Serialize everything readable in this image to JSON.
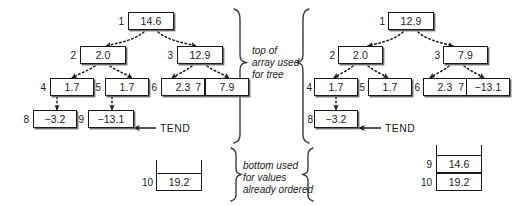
{
  "figure": {
    "pointer_label_left": "TEND",
    "pointer_label_right": "TEND",
    "captions": {
      "top": [
        "top of",
        "array used",
        "for tree"
      ],
      "bottom": [
        "bottom used",
        "for values",
        "already ordered"
      ]
    }
  },
  "left_diagram": {
    "name": "before-extraction",
    "tree_nodes": [
      {
        "index": "1",
        "value": "14.6",
        "row": 0
      },
      {
        "index": "2",
        "value": "2.0",
        "row": 1
      },
      {
        "index": "3",
        "value": "12.9",
        "row": 1
      },
      {
        "index": "4",
        "value": "1.7",
        "row": 2
      },
      {
        "index": "5",
        "value": "1.7",
        "row": 2
      },
      {
        "index": "6",
        "value": "2.3",
        "row": 2
      },
      {
        "index": "7",
        "value": "7.9",
        "row": 2
      },
      {
        "index": "8",
        "value": "−3.2",
        "row": 3
      },
      {
        "index": "9",
        "value": "−13.1",
        "row": 3
      }
    ],
    "sorted_cells": [
      {
        "index": "10",
        "value": "19.2"
      }
    ],
    "tend_target_index": "9"
  },
  "right_diagram": {
    "name": "after-extraction",
    "tree_nodes": [
      {
        "index": "1",
        "value": "12.9",
        "row": 0
      },
      {
        "index": "2",
        "value": "2.0",
        "row": 1
      },
      {
        "index": "3",
        "value": "7.9",
        "row": 1
      },
      {
        "index": "4",
        "value": "1.7",
        "row": 2
      },
      {
        "index": "5",
        "value": "1.7",
        "row": 2
      },
      {
        "index": "6",
        "value": "2.3",
        "row": 2
      },
      {
        "index": "7",
        "value": "−13.1",
        "row": 2
      },
      {
        "index": "8",
        "value": "−3.2",
        "row": 3
      }
    ],
    "sorted_cells": [
      {
        "index": "9",
        "value": "14.6"
      },
      {
        "index": "10",
        "value": "19.2"
      }
    ],
    "tend_target_index": "8"
  },
  "colors": {
    "ink": "#1a1a1a",
    "paper": "#ffffff",
    "shadow": "#6b6b6b"
  }
}
